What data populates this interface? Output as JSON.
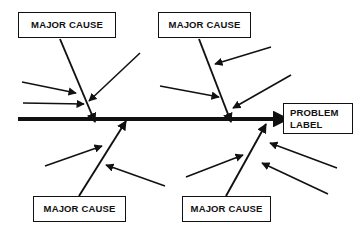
{
  "diagram": {
    "type": "fishbone",
    "background_color": "#ffffff",
    "line_color": "#111111",
    "spine": {
      "label": "main-spine",
      "x1": 18,
      "y1": 119,
      "x2": 288,
      "y2": 119,
      "thickness": 4,
      "arrow": "right"
    },
    "problem": {
      "line1": "PROBLEM",
      "line2": "LABEL"
    },
    "major_causes": [
      {
        "id": "top-left",
        "label": "MAJOR CAUSE"
      },
      {
        "id": "top-right",
        "label": "MAJOR CAUSE"
      },
      {
        "id": "bottom-left",
        "label": "MAJOR CAUSE"
      },
      {
        "id": "bottom-right",
        "label": "MAJOR CAUSE"
      }
    ],
    "branches": [
      {
        "id": "branch-top-left",
        "from_box": "top-left",
        "x1": 60,
        "y1": 39,
        "x2": 95,
        "y2": 122,
        "arrow": "end",
        "sub_causes": [
          {
            "id": "sub-tl-1",
            "x1": 22,
            "y1": 82,
            "x2": 76,
            "y2": 93,
            "arrow": "end"
          },
          {
            "id": "sub-tl-2",
            "x1": 23,
            "y1": 103,
            "x2": 84,
            "y2": 104,
            "arrow": "end"
          },
          {
            "id": "sub-tl-3",
            "x1": 140,
            "y1": 53,
            "x2": 89,
            "y2": 101,
            "arrow": "end"
          }
        ]
      },
      {
        "id": "branch-top-right",
        "from_box": "top-right",
        "x1": 199,
        "y1": 39,
        "x2": 231,
        "y2": 122,
        "arrow": "end",
        "sub_causes": [
          {
            "id": "sub-tr-1",
            "x1": 271,
            "y1": 47,
            "x2": 215,
            "y2": 64,
            "arrow": "end"
          },
          {
            "id": "sub-tr-2",
            "x1": 160,
            "y1": 86,
            "x2": 219,
            "y2": 97,
            "arrow": "end"
          },
          {
            "id": "sub-tr-3",
            "x1": 291,
            "y1": 75,
            "x2": 233,
            "y2": 108,
            "arrow": "end"
          }
        ]
      },
      {
        "id": "branch-bottom-left",
        "from_box": "bottom-left",
        "x1": 79,
        "y1": 196,
        "x2": 126,
        "y2": 121,
        "arrow": "end",
        "sub_causes": [
          {
            "id": "sub-bl-1",
            "x1": 45,
            "y1": 166,
            "x2": 102,
            "y2": 146,
            "arrow": "end"
          },
          {
            "id": "sub-bl-2",
            "x1": 165,
            "y1": 186,
            "x2": 106,
            "y2": 165,
            "arrow": "end"
          }
        ]
      },
      {
        "id": "branch-bottom-right",
        "from_box": "bottom-right",
        "x1": 226,
        "y1": 196,
        "x2": 266,
        "y2": 124,
        "arrow": "end",
        "sub_causes": [
          {
            "id": "sub-br-1",
            "x1": 186,
            "y1": 177,
            "x2": 243,
            "y2": 155,
            "arrow": "end"
          },
          {
            "id": "sub-br-2",
            "x1": 337,
            "y1": 168,
            "x2": 270,
            "y2": 143,
            "arrow": "end"
          },
          {
            "id": "sub-br-3",
            "x1": 328,
            "y1": 194,
            "x2": 262,
            "y2": 163,
            "arrow": "end"
          }
        ]
      }
    ]
  }
}
